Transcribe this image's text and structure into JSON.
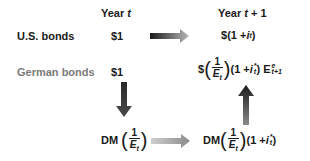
{
  "diagram": {
    "headers": {
      "year_t": {
        "text": "Year ",
        "var": "t"
      },
      "year_t1": {
        "text": "Year ",
        "var": "t",
        "suffix": " + 1"
      }
    },
    "rows": {
      "us": {
        "label": "U.S. bonds",
        "initial": "$1",
        "result": {
          "prefix": "$",
          "open": "(1 + ",
          "var": "i",
          "sub": "t",
          "close": ")"
        }
      },
      "german": {
        "label": "German bonds",
        "initial": "$1",
        "result": {
          "prefix": "$",
          "frac_num": "1",
          "frac_den": "E",
          "frac_den_sub": "t",
          "open": "(1 + ",
          "var": "i",
          "sup": "*",
          "sub": "t",
          "close": ")",
          "exp_var": "E",
          "exp_sup": "e",
          "exp_sub": "t+1"
        }
      }
    },
    "lower": {
      "left": {
        "currency": "DM",
        "frac_num": "1",
        "frac_den": "E",
        "frac_den_sub": "t"
      },
      "right": {
        "currency": "DM",
        "frac_num": "1",
        "frac_den": "E",
        "frac_den_sub": "t",
        "open": "(1 + ",
        "var": "i",
        "sup": "*",
        "sub": "t",
        "close": ")"
      }
    },
    "arrows": [
      {
        "name": "us-right-arrow",
        "direction": "right",
        "from": "$1 (Year t)",
        "to": "$(1 + i_t)",
        "gradient": [
          "#1a1a1a",
          "#b0b0b0"
        ]
      },
      {
        "name": "convert-down-arrow",
        "direction": "down",
        "from": "$1 German",
        "to": "DM(1/E_t)",
        "gradient": [
          "#3a3a3a",
          "#3a3a3a"
        ]
      },
      {
        "name": "dm-right-arrow",
        "direction": "right",
        "from": "DM(1/E_t)",
        "to": "DM(1/E_t)(1 + i*_t)",
        "gradient": [
          "#c0c0c0",
          "#8a8a8a"
        ]
      },
      {
        "name": "convert-up-arrow",
        "direction": "up",
        "from": "DM(1/E_t)(1 + i*_t)",
        "to": "$(1/E_t)(1 + i*_t)E^e_t+1",
        "gradient": [
          "#8a8a8a",
          "#1a1a1a"
        ]
      }
    ],
    "colors": {
      "text_dark": "#1a1a1a",
      "text_gray": "#7a7a7a",
      "background": "#ffffff"
    }
  }
}
